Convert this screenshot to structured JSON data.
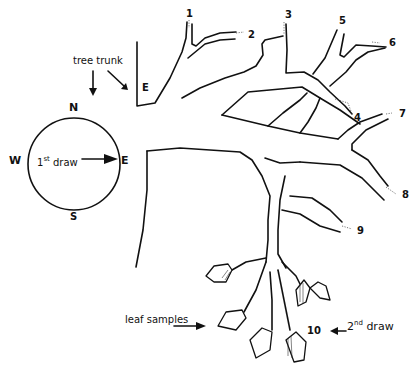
{
  "diagram": {
    "title": "",
    "labels": {
      "tree_trunk": "tree trunk",
      "east_marker": "E",
      "leaf_samples": "leaf samples",
      "first_draw_num": "1",
      "first_draw_sup": "st",
      "first_draw_word": "draw",
      "second_draw_num": "2",
      "second_draw_sup": "nd",
      "second_draw_word": "draw"
    },
    "compass": {
      "north": "N",
      "south": "S",
      "east": "E",
      "west": "W"
    },
    "branch_tips": [
      "1",
      "2",
      "3",
      "4",
      "5",
      "6",
      "7",
      "8",
      "9",
      "10"
    ],
    "colors": {
      "ink": "#111111",
      "background": "#ffffff"
    }
  }
}
